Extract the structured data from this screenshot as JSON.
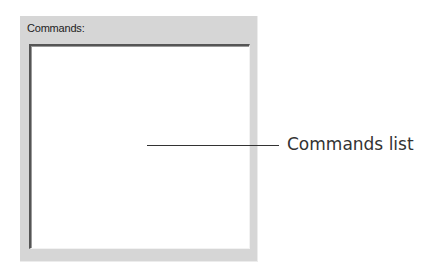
{
  "panel": {
    "label": "Commands:",
    "list_items": []
  },
  "callout": {
    "text": "Commands list"
  },
  "colors": {
    "panel_bg": "#d6d6d6",
    "list_bg": "#ffffff",
    "callout_line": "#333333"
  }
}
